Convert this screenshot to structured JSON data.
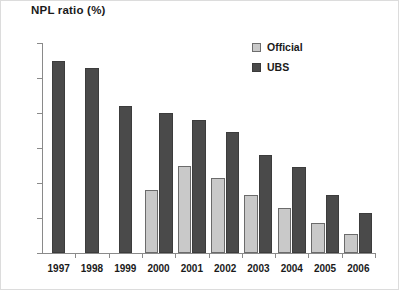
{
  "title": "NPL ratio (%)",
  "legend": {
    "items": [
      {
        "label": "Official",
        "color": "#c9c9c9"
      },
      {
        "label": "UBS",
        "color": "#4a4a4a"
      }
    ]
  },
  "axis": {
    "y_ticks": [
      "60",
      "50",
      "40",
      "30",
      "20",
      "10",
      "0"
    ],
    "x_ticks": [
      "1997",
      "1998",
      "1999",
      "2000",
      "2001",
      "2002",
      "2003",
      "2004",
      "2005",
      "2006"
    ]
  },
  "chart_data": {
    "type": "bar",
    "title": "NPL ratio (%)",
    "xlabel": "",
    "ylabel": "",
    "ylim": [
      0,
      60
    ],
    "ytick_step": 10,
    "grid": false,
    "legend_position": "top-right",
    "categories": [
      "1997",
      "1998",
      "1999",
      "2000",
      "2001",
      "2002",
      "2003",
      "2004",
      "2005",
      "2006"
    ],
    "series": [
      {
        "name": "Official",
        "color": "#c9c9c9",
        "values": [
          null,
          null,
          null,
          18,
          25,
          21.5,
          16.5,
          13,
          8.5,
          5.5
        ]
      },
      {
        "name": "UBS",
        "color": "#4a4a4a",
        "values": [
          55,
          53,
          42,
          40,
          38,
          34.5,
          28,
          24.5,
          16.5,
          11.5
        ]
      }
    ]
  }
}
